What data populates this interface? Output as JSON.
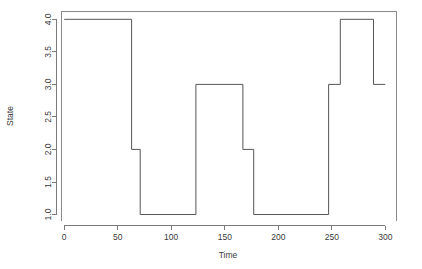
{
  "chart_data": {
    "type": "line",
    "subtype": "step",
    "title": "",
    "xlabel": "Time",
    "ylabel": "State",
    "xlim": [
      -3,
      310
    ],
    "ylim": [
      0.9,
      4.12
    ],
    "grid": false,
    "legend": null,
    "xticks": [
      0,
      50,
      100,
      150,
      200,
      250,
      300
    ],
    "xtick_labels": [
      "0",
      "50",
      "100",
      "150",
      "200",
      "250",
      "300"
    ],
    "yticks": [
      1.0,
      1.5,
      2.0,
      2.5,
      3.0,
      3.5,
      4.0
    ],
    "ytick_labels": [
      "1.0",
      "1.5",
      "2.0",
      "2.5",
      "3.0",
      "3.5",
      "4.0"
    ],
    "line_color": "#555555",
    "series": [
      {
        "name": "State",
        "step_mode": "post",
        "x": [
          0,
          63,
          71,
          123,
          167,
          177,
          247,
          258,
          289,
          300
        ],
        "y": [
          4,
          2,
          1,
          3,
          2,
          1,
          3,
          4,
          3,
          3
        ]
      }
    ],
    "segments": [
      {
        "x_start": 0,
        "x_end": 63,
        "state": 4
      },
      {
        "x_start": 63,
        "x_end": 71,
        "state": 2
      },
      {
        "x_start": 71,
        "x_end": 123,
        "state": 1
      },
      {
        "x_start": 123,
        "x_end": 167,
        "state": 3
      },
      {
        "x_start": 167,
        "x_end": 177,
        "state": 2
      },
      {
        "x_start": 177,
        "x_end": 247,
        "state": 1
      },
      {
        "x_start": 247,
        "x_end": 258,
        "state": 3
      },
      {
        "x_start": 258,
        "x_end": 289,
        "state": 4
      },
      {
        "x_start": 289,
        "x_end": 300,
        "state": 3
      }
    ]
  }
}
